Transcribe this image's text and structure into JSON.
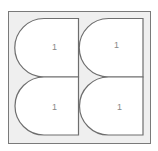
{
  "diagram": {
    "frame": {
      "fill": "#efefef",
      "stroke": "#7a7a7a"
    },
    "tile_fill": "#ffffff",
    "tile_stroke": "#6e6e6e",
    "tiles": [
      {
        "label": "1",
        "position": "top-left"
      },
      {
        "label": "1",
        "position": "top-right"
      },
      {
        "label": "1",
        "position": "bottom-left"
      },
      {
        "label": "1",
        "position": "bottom-right"
      }
    ]
  }
}
